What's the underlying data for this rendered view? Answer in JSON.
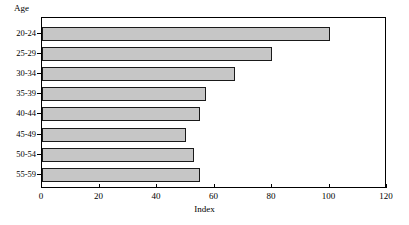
{
  "chart_data": {
    "type": "bar",
    "orientation": "horizontal",
    "title": "",
    "xlabel": "Index",
    "ylabel": "Age",
    "categories": [
      "20-24",
      "25-29",
      "30-34",
      "35-39",
      "40-44",
      "45-49",
      "50-54",
      "55-59"
    ],
    "values": [
      100,
      80,
      67,
      57,
      55,
      50,
      53,
      55
    ],
    "xlim": [
      0,
      120
    ],
    "xticks": [
      0,
      20,
      40,
      60,
      80,
      100,
      120
    ],
    "xtick_labels": [
      "0",
      "20",
      "40",
      "60",
      "80",
      "100",
      "120"
    ],
    "grid": false,
    "legend": false,
    "bar_color": "#c6c6c6",
    "bar_edge_color": "#1a1a1a",
    "frame_color": "#000000",
    "background": "#ffffff"
  }
}
